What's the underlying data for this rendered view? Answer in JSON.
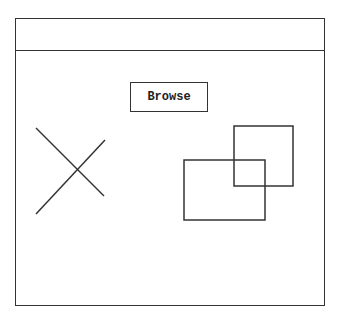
{
  "window": {
    "title_bar": ""
  },
  "toolbar": {
    "browse_label": "Browse"
  },
  "placeholders": {
    "image_placeholder": "image-x-placeholder",
    "shapes": "overlapping-rectangles"
  },
  "colors": {
    "stroke": "#333333",
    "background": "#ffffff"
  }
}
